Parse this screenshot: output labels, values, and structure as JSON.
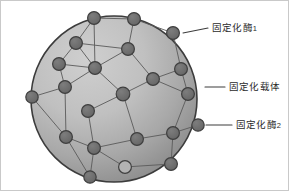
{
  "figure": {
    "background_color": "#ffffff",
    "border_color": "#c9c9c9",
    "width": 289,
    "height": 191
  },
  "sphere": {
    "name": "immobilization-carrier-sphere",
    "center": {
      "x": 113,
      "y": 98
    },
    "radius": 83,
    "fill_light": "#c4c4c4",
    "fill_dark": "#8e8e8e",
    "outline_color": "#3c3c3c",
    "outline_width": 1.6
  },
  "node_style": {
    "fill": "#6f6f6f",
    "stroke": "#3f3f3f",
    "stroke_width": 1.2,
    "radius": 6.2,
    "count": 22
  },
  "link_style": {
    "stroke": "#5a5a5a",
    "stroke_width": 0.9
  },
  "nodes": [
    {
      "id": "n1",
      "x": 93,
      "y": 17,
      "r": 6.4,
      "label": "enzyme-node"
    },
    {
      "id": "n2",
      "x": 133,
      "y": 18,
      "r": 6.4,
      "label": "enzyme-node"
    },
    {
      "id": "n3",
      "x": 172,
      "y": 32,
      "r": 6.4,
      "label": "enzyme-node-callout1"
    },
    {
      "id": "n4",
      "x": 75,
      "y": 42,
      "r": 6.4,
      "label": "enzyme-node"
    },
    {
      "id": "n5",
      "x": 127,
      "y": 48,
      "r": 6.4,
      "label": "enzyme-node"
    },
    {
      "id": "n6",
      "x": 58,
      "y": 63,
      "r": 6.4,
      "label": "enzyme-node"
    },
    {
      "id": "n7",
      "x": 94,
      "y": 67,
      "r": 6.4,
      "label": "enzyme-node"
    },
    {
      "id": "n8",
      "x": 180,
      "y": 68,
      "r": 6.4,
      "label": "enzyme-node"
    },
    {
      "id": "n9",
      "x": 64,
      "y": 86,
      "r": 6.4,
      "label": "enzyme-node"
    },
    {
      "id": "n10",
      "x": 152,
      "y": 78,
      "r": 6.4,
      "label": "enzyme-node"
    },
    {
      "id": "n11",
      "x": 122,
      "y": 93,
      "r": 6.8,
      "label": "enzyme-node"
    },
    {
      "id": "n12",
      "x": 187,
      "y": 93,
      "r": 6.4,
      "label": "enzyme-node"
    },
    {
      "id": "n13",
      "x": 31,
      "y": 96,
      "r": 6.2,
      "label": "enzyme-node-edge"
    },
    {
      "id": "n14",
      "x": 87,
      "y": 110,
      "r": 6.4,
      "label": "enzyme-node"
    },
    {
      "id": "n15",
      "x": 65,
      "y": 136,
      "r": 6.4,
      "label": "enzyme-node"
    },
    {
      "id": "n16",
      "x": 136,
      "y": 138,
      "r": 6.4,
      "label": "enzyme-node"
    },
    {
      "id": "n17",
      "x": 172,
      "y": 132,
      "r": 6.4,
      "label": "enzyme-node"
    },
    {
      "id": "n18",
      "x": 197,
      "y": 124,
      "r": 6.2,
      "label": "enzyme-node-callout2"
    },
    {
      "id": "n19",
      "x": 93,
      "y": 147,
      "r": 6.4,
      "label": "enzyme-node"
    },
    {
      "id": "n20",
      "x": 124,
      "y": 166,
      "r": 6.4,
      "label": "enzyme-node-hollow"
    },
    {
      "id": "n21",
      "x": 170,
      "y": 163,
      "r": 6.4,
      "label": "enzyme-node"
    },
    {
      "id": "n22",
      "x": 89,
      "y": 176,
      "r": 6.2,
      "label": "enzyme-node-edge"
    }
  ],
  "links": [
    [
      "n1",
      "n2"
    ],
    [
      "n2",
      "n3"
    ],
    [
      "n1",
      "n4"
    ],
    [
      "n4",
      "n5"
    ],
    [
      "n4",
      "n6"
    ],
    [
      "n4",
      "n7"
    ],
    [
      "n5",
      "n7"
    ],
    [
      "n5",
      "n10"
    ],
    [
      "n6",
      "n7"
    ],
    [
      "n6",
      "n9"
    ],
    [
      "n7",
      "n9"
    ],
    [
      "n7",
      "n11"
    ],
    [
      "n3",
      "n8"
    ],
    [
      "n8",
      "n10"
    ],
    [
      "n8",
      "n12"
    ],
    [
      "n10",
      "n11"
    ],
    [
      "n10",
      "n12"
    ],
    [
      "n11",
      "n14"
    ],
    [
      "n11",
      "n16"
    ],
    [
      "n9",
      "n13"
    ],
    [
      "n9",
      "n15"
    ],
    [
      "n13",
      "n15"
    ],
    [
      "n14",
      "n19"
    ],
    [
      "n15",
      "n19"
    ],
    [
      "n16",
      "n17"
    ],
    [
      "n16",
      "n19"
    ],
    [
      "n17",
      "n18"
    ],
    [
      "n12",
      "n17"
    ],
    [
      "n19",
      "n22"
    ],
    [
      "n19",
      "n20"
    ],
    [
      "n20",
      "n21"
    ],
    [
      "n17",
      "n21"
    ],
    [
      "n2",
      "n5"
    ],
    [
      "n1",
      "n7"
    ],
    [
      "n15",
      "n22"
    ]
  ],
  "callouts": [
    {
      "id": "callout-1",
      "name": "callout-immobilized-enzyme-1",
      "label_main": "固定化酶",
      "label_sub": "1",
      "line": {
        "x1": 182,
        "y1": 32,
        "x2": 207,
        "y2": 27
      },
      "text_x": 211,
      "text_y": 21
    },
    {
      "id": "callout-2",
      "name": "callout-immobilization-carrier",
      "label_main": "固定化载体",
      "label_sub": "",
      "line": {
        "x1": 204,
        "y1": 86,
        "x2": 224,
        "y2": 86
      },
      "text_x": 228,
      "text_y": 80
    },
    {
      "id": "callout-3",
      "name": "callout-immobilized-enzyme-2",
      "label_main": "固定化酶",
      "label_sub": "2",
      "line": {
        "x1": 205,
        "y1": 124,
        "x2": 231,
        "y2": 124
      },
      "text_x": 235,
      "text_y": 118
    }
  ],
  "callout_line_style": {
    "stroke": "#3c3c3c",
    "stroke_width": 1.1
  }
}
